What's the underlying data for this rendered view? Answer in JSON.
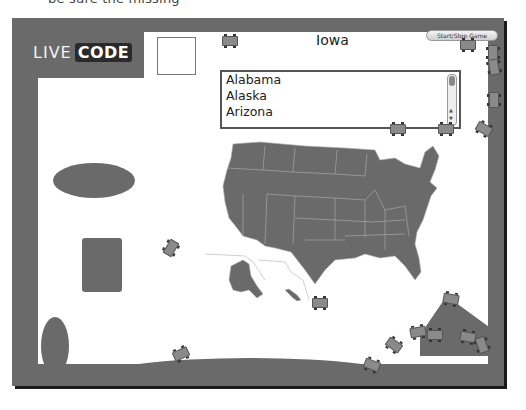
{
  "page_caption": "be sure the missing",
  "app": {
    "logo_live": "LIVE",
    "logo_code": "CODE",
    "state_title": "Iowa",
    "start_stop_button": "Start/Stop Game"
  },
  "state_list": {
    "items": [
      "Alabama",
      "Alaska",
      "Arizona"
    ],
    "selected": null
  },
  "map": {
    "name": "us-states-map",
    "fill": "#6a6a6a",
    "stroke": "#b0b0b0"
  },
  "colors": {
    "frame": "#6a6a6a",
    "canvas": "#ffffff",
    "shadow": "#1a1a1a"
  }
}
